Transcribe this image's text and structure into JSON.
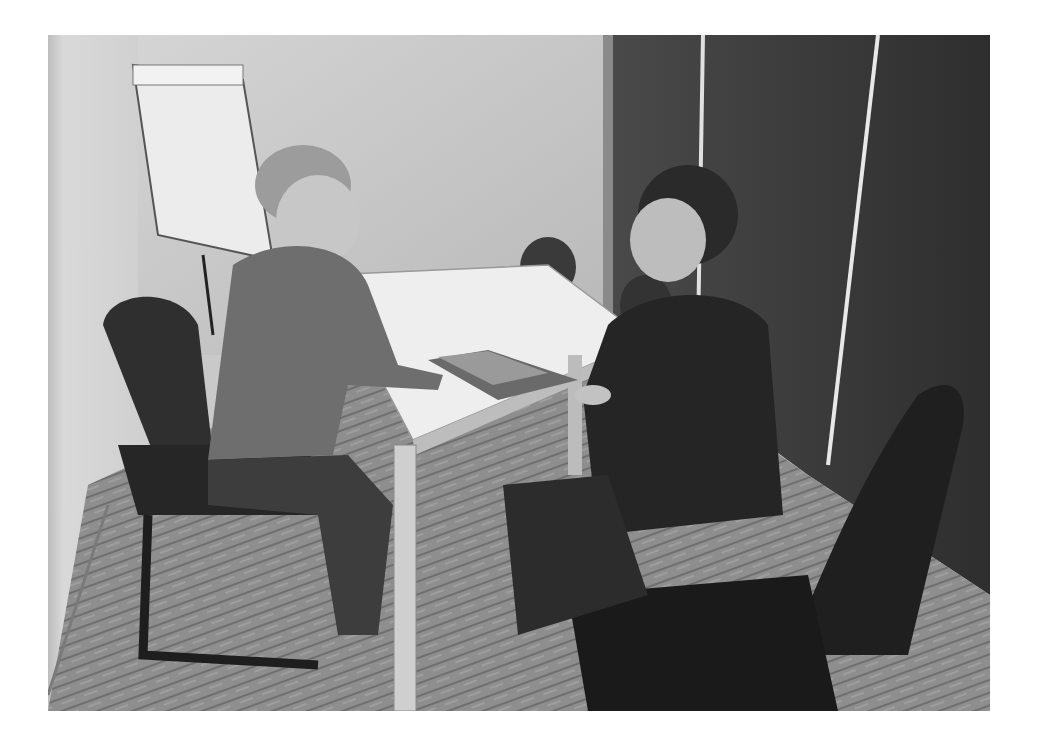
{
  "image": {
    "description": "Black and white photograph of two women seated across a white table in a small meeting room, smiling at each other, with a flip chart in the corner and dark partition walls.",
    "scene": {
      "room": "small meeting room",
      "people": [
        {
          "position": "left",
          "description": "woman with hair in a bun, long-sleeve top, seated in office chair, hands on table"
        },
        {
          "position": "right",
          "description": "woman with ponytail, dark leather jacket, seated in office chair, hand on table"
        }
      ],
      "objects": [
        "white table",
        "magazine on table",
        "flip chart easel",
        "office chairs",
        "patterned carpet",
        "dark partition wall"
      ]
    },
    "colors": {
      "wall_light": "#d8d8d8",
      "wall_dark": "#3a3a3a",
      "table": "#eeeeee",
      "carpet": "#8a8a8a",
      "chair": "#2a2a2a"
    }
  }
}
